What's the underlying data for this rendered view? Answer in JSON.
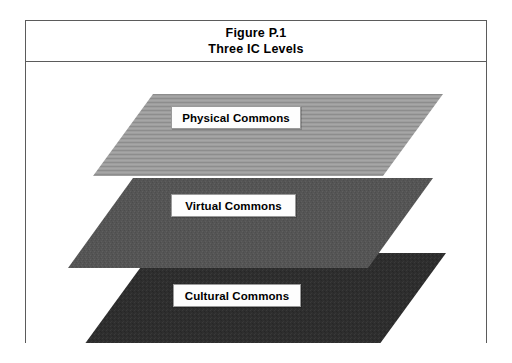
{
  "figure": {
    "title_line1": "Figure P.1",
    "title_line2": "Three IC Levels"
  },
  "colors": {
    "frame_border": "#5b5b5b",
    "page_background": "#ffffff",
    "label_background": "#fdfdfd",
    "label_border": "#9a9a9a",
    "label_text": "#000000",
    "layer_physical": "#9e9e9e",
    "layer_physical_stripe": "#8d8d8d",
    "layer_virtual": "#555555",
    "layer_cultural": "#2e2e2e"
  },
  "diagram": {
    "type": "layered-parallelogram-stack",
    "layer_count": 3,
    "layers": [
      {
        "id": "physical",
        "label": "Physical Commons",
        "order": 1,
        "position": "top",
        "fill": "#9e9e9e",
        "texture": "horizontal-stripes",
        "points": "127,32 417,32 357,114 67,114"
      },
      {
        "id": "virtual",
        "label": "Virtual Commons",
        "order": 2,
        "position": "middle",
        "fill": "#555555",
        "texture": "noise",
        "points": "107,116 407,116 342,206 42,206"
      },
      {
        "id": "cultural",
        "label": "Cultural Commons",
        "order": 3,
        "position": "bottom",
        "fill": "#2e2e2e",
        "texture": "noise",
        "points": "125,191 420,191 345,294 50,294"
      }
    ]
  }
}
